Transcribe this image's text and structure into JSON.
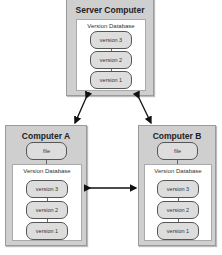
{
  "server": {
    "title": "Server Computer",
    "database_label": "Version Database",
    "versions": [
      "version 3",
      "version 2",
      "version 1"
    ]
  },
  "computer_a": {
    "title": "Computer A",
    "file_label": "file",
    "database_label": "Version Database",
    "versions": [
      "version 3",
      "version 2",
      "version 1"
    ]
  },
  "computer_b": {
    "title": "Computer B",
    "file_label": "file",
    "database_label": "Version Database",
    "versions": [
      "version 3",
      "version 2",
      "version 1"
    ]
  }
}
